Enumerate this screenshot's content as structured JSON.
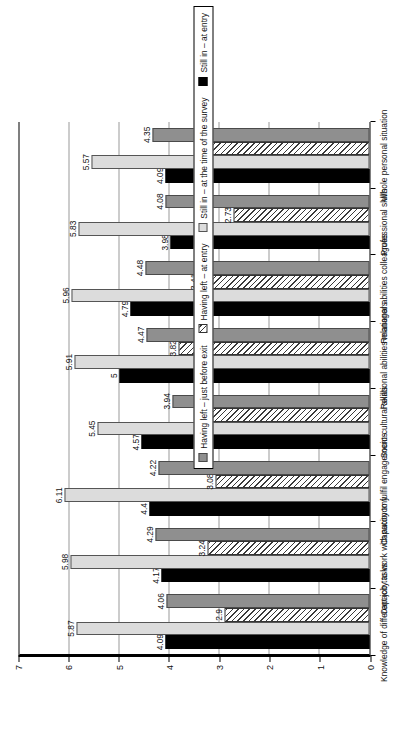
{
  "chart_data": {
    "type": "bar",
    "title": "",
    "xlabel": "",
    "ylabel": "",
    "ylim": [
      0,
      7
    ],
    "yticks": [
      0,
      1,
      2,
      3,
      4,
      5,
      6,
      7
    ],
    "ytick_labels": [
      "0",
      "1",
      "2",
      "3",
      "4",
      "5",
      "6",
      "7"
    ],
    "grid": true,
    "orientation": "vertical-rotated",
    "legend_position": "right",
    "categories": [
      "Knowledge of different job tasks",
      "Capacity to work with autonomy",
      "Capacity to fulfil engagements",
      "Socio-cultural skills",
      "Relational abilities managers",
      "Relational abilities colleagues",
      "Professional skills",
      "Whole personal situation"
    ],
    "series": [
      {
        "name": "Still in – at entry",
        "color": "#000000",
        "pattern": "solid-black",
        "values": [
          4.09,
          4.17,
          4.4,
          4.57,
          5,
          4.79,
          3.98,
          4.09
        ],
        "labels": [
          "4.09",
          "4.17",
          "4.4",
          "4.57",
          "5",
          "4.79",
          "3.98",
          "4.09"
        ]
      },
      {
        "name": "Still in – at the time of the survey",
        "color": "#dcdcdc",
        "pattern": "solid-light-gray",
        "values": [
          5.87,
          5.98,
          6.11,
          5.45,
          5.91,
          5.96,
          5.83,
          5.57
        ],
        "labels": [
          "5.87",
          "5.98",
          "6.11",
          "5.45",
          "5.91",
          "5.96",
          "5.83",
          "5.57"
        ]
      },
      {
        "name": "Having left – at entry",
        "color": "#ffffff",
        "pattern": "diagonal-hatch",
        "values": [
          2.9,
          3.24,
          3.08,
          3.17,
          3.82,
          3.41,
          2.73,
          3.29
        ],
        "labels": [
          "2.9",
          "3.24",
          "3.08",
          "3.17",
          "3.82",
          "3.41",
          "2.73",
          "3.29"
        ]
      },
      {
        "name": "Having left – just before exit",
        "color": "#8f8f8f",
        "pattern": "solid-mid-gray",
        "values": [
          4.06,
          4.29,
          4.22,
          3.94,
          4.47,
          4.48,
          4.08,
          4.35
        ],
        "labels": [
          "4.06",
          "4.29",
          "4.22",
          "3.94",
          "4.47",
          "4.48",
          "4.08",
          "4.35"
        ]
      }
    ],
    "legend_display_order": [
      "Having left – just before exit",
      "Having left – at entry",
      "Still in – at the time of the survey",
      "Still in – at entry"
    ]
  }
}
